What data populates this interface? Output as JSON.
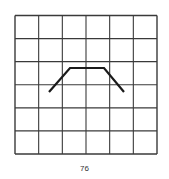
{
  "figure": {
    "grid": {
      "rows": 6,
      "cols": 6,
      "x0": 15,
      "y0": 15.5,
      "x1": 157,
      "y1": 154,
      "line_color": "#3a3a3a"
    },
    "path": {
      "description": "trapezoid-shaped polyline",
      "points": [
        [
          49,
          92
        ],
        [
          70,
          68
        ],
        [
          104,
          68
        ],
        [
          124,
          92
        ]
      ],
      "color": "#1a1a1a"
    }
  },
  "page_number": "76"
}
